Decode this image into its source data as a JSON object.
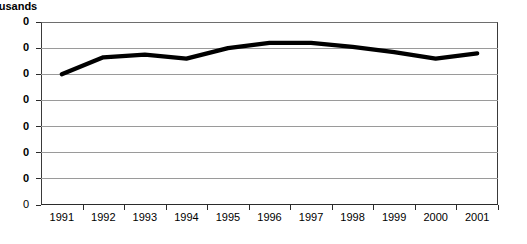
{
  "chart_data": {
    "type": "line",
    "title": "",
    "axis_caption": "ousands",
    "axis_caption_full": "Thousands",
    "xlabel": "",
    "ylabel": "",
    "categories": [
      "1991",
      "1992",
      "1993",
      "1994",
      "1995",
      "1996",
      "1997",
      "1998",
      "1999",
      "2000",
      "2001"
    ],
    "series": [
      {
        "name": "Series 1",
        "values": [
          50.0,
          56.5,
          57.5,
          56.0,
          60.0,
          62.0,
          62.0,
          60.5,
          58.5,
          56.0,
          58.0
        ]
      }
    ],
    "ylim": [
      0,
      70
    ],
    "ytick_values": [
      70,
      60,
      50,
      40,
      30,
      20,
      10,
      0
    ],
    "ytick_labels": [
      "0",
      "0",
      "0",
      "0",
      "0",
      "0",
      "0",
      "0"
    ],
    "ytick_labels_clipped": true,
    "ytick_labels_full": [
      "70",
      "60",
      "50",
      "40",
      "30",
      "20",
      "10",
      "0"
    ],
    "grid": true,
    "legend": "none",
    "line_color": "#000000",
    "grid_color": "#9a9a9a",
    "axis_color": "#2b2b2b"
  }
}
